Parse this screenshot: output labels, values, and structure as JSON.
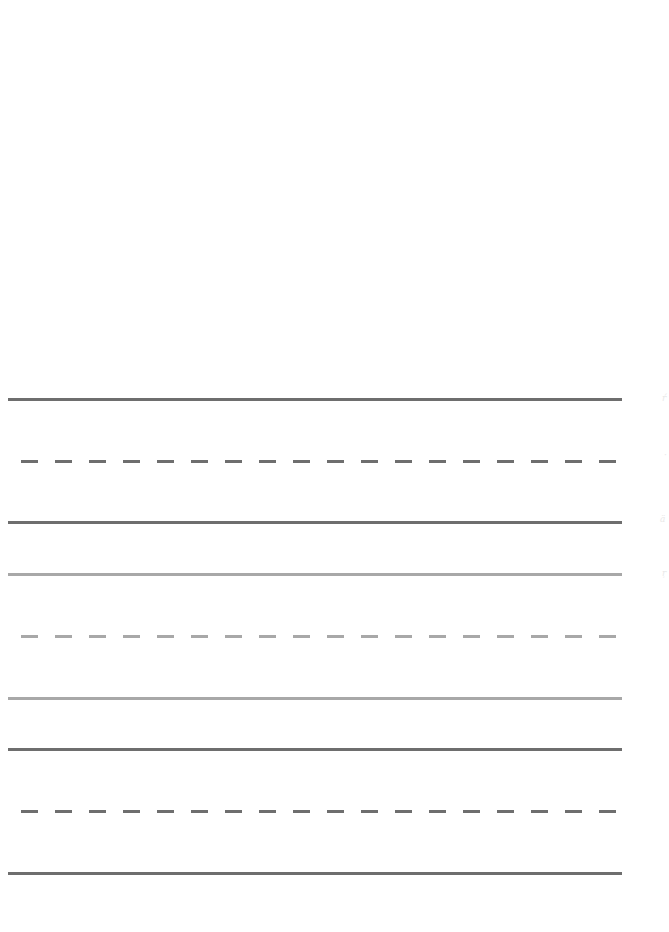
{
  "page": {
    "type": "handwriting practice sheet",
    "background": "#ffffff"
  },
  "colors": {
    "dark_line": "#6e6e6e",
    "light_line": "#a8a8a8"
  },
  "line_groups": [
    {
      "name": "group-1",
      "shade": "dark",
      "lines": [
        {
          "role": "top",
          "style": "solid",
          "y": 399
        },
        {
          "role": "midline",
          "style": "dashed",
          "y": 461
        },
        {
          "role": "baseline",
          "style": "solid",
          "y": 522
        }
      ]
    },
    {
      "name": "group-2",
      "shade": "light",
      "lines": [
        {
          "role": "top",
          "style": "solid",
          "y": 574
        },
        {
          "role": "midline",
          "style": "dashed",
          "y": 636
        },
        {
          "role": "baseline",
          "style": "solid",
          "y": 698
        }
      ]
    },
    {
      "name": "group-3",
      "shade": "dark",
      "lines": [
        {
          "role": "top",
          "style": "solid",
          "y": 749
        },
        {
          "role": "midline",
          "style": "dashed",
          "y": 811
        },
        {
          "role": "baseline",
          "style": "solid",
          "y": 873
        }
      ]
    }
  ],
  "edge_marks": [
    "ŕ",
    "·",
    "ä",
    "ŗ"
  ]
}
